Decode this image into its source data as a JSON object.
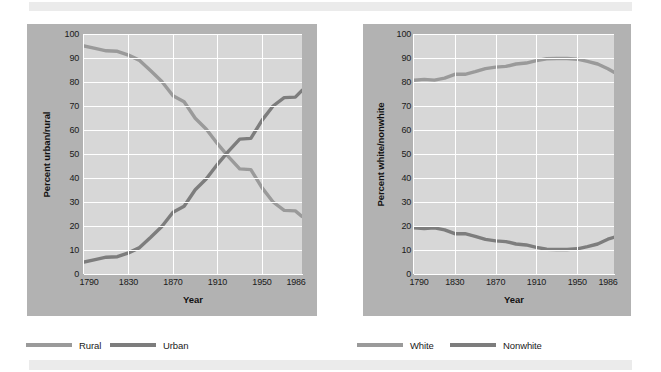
{
  "figure": {
    "background_color": "#ffffff",
    "frame_color": "#b2b2b2",
    "plot_color": "#d7d7d7",
    "grid_color": "#ffffff"
  },
  "legend": {
    "items": [
      {
        "label": "Rural",
        "color": "#9a9a9a",
        "swatch_name": "legend-swatch-rural"
      },
      {
        "label": "Urban",
        "color": "#7d7d7d",
        "swatch_name": "legend-swatch-urban"
      },
      {
        "label": "White",
        "color": "#9a9a9a",
        "swatch_name": "legend-swatch-white"
      },
      {
        "label": "Nonwhite",
        "color": "#7d7d7d",
        "swatch_name": "legend-swatch-nonwhite"
      }
    ]
  },
  "chart_data": [
    {
      "type": "line",
      "title": "",
      "xlabel": "Year",
      "ylabel": "Percent urban/rural",
      "xlim": [
        1790,
        1986
      ],
      "ylim": [
        0,
        100
      ],
      "grid": true,
      "legend_position": "below-figure",
      "xticks": [
        1790,
        1830,
        1870,
        1910,
        1950,
        1986
      ],
      "xtick_labels": [
        "1790",
        "1830",
        "1870",
        "1910",
        "1950",
        "1986"
      ],
      "yticks": [
        0,
        10,
        20,
        30,
        40,
        50,
        60,
        70,
        80,
        90,
        100
      ],
      "ytick_labels": [
        "0",
        "10",
        "20",
        "30",
        "40",
        "50",
        "60",
        "70",
        "80",
        "90",
        "100"
      ],
      "x": [
        1790,
        1800,
        1810,
        1820,
        1830,
        1840,
        1850,
        1860,
        1870,
        1880,
        1890,
        1900,
        1910,
        1920,
        1930,
        1940,
        1950,
        1960,
        1970,
        1980,
        1986
      ],
      "series": [
        {
          "name": "Rural",
          "color": "#9a9a9a",
          "values": [
            95,
            94,
            93,
            92.8,
            91.2,
            89,
            84.7,
            80.2,
            74.3,
            71.8,
            64.9,
            60.3,
            54.3,
            48.8,
            43.8,
            43.5,
            36,
            30,
            26.5,
            26.3,
            24
          ]
        },
        {
          "name": "Urban",
          "color": "#7d7d7d",
          "values": [
            5,
            6,
            7,
            7.2,
            8.8,
            11,
            15.3,
            19.8,
            25.7,
            28.2,
            35.1,
            39.7,
            45.7,
            51.2,
            56.2,
            56.5,
            64,
            70,
            73.5,
            73.7,
            76.5
          ]
        }
      ]
    },
    {
      "type": "line",
      "title": "",
      "xlabel": "Year",
      "ylabel": "Percent white/nonwhite",
      "xlim": [
        1790,
        1986
      ],
      "ylim": [
        0,
        100
      ],
      "grid": true,
      "legend_position": "below-figure",
      "xticks": [
        1790,
        1830,
        1870,
        1910,
        1950,
        1986
      ],
      "xtick_labels": [
        "1790",
        "1830",
        "1870",
        "1910",
        "1950",
        "1986"
      ],
      "yticks": [
        0,
        10,
        20,
        30,
        40,
        50,
        60,
        70,
        80,
        90,
        100
      ],
      "ytick_labels": [
        "0",
        "10",
        "20",
        "30",
        "40",
        "50",
        "60",
        "70",
        "80",
        "90",
        "100"
      ],
      "x": [
        1790,
        1800,
        1810,
        1820,
        1830,
        1840,
        1850,
        1860,
        1870,
        1880,
        1890,
        1900,
        1910,
        1920,
        1930,
        1940,
        1950,
        1960,
        1970,
        1980,
        1986
      ],
      "series": [
        {
          "name": "White",
          "color": "#9a9a9a",
          "values": [
            80.7,
            81.1,
            80.8,
            81.6,
            83.2,
            83.2,
            84.3,
            85.6,
            86.2,
            86.5,
            87.5,
            87.9,
            88.9,
            89.7,
            89.8,
            89.8,
            89.5,
            88.6,
            87.5,
            85.5,
            84.1
          ]
        },
        {
          "name": "Nonwhite",
          "color": "#7d7d7d",
          "values": [
            19.3,
            18.9,
            19.2,
            18.4,
            16.8,
            16.8,
            15.7,
            14.4,
            13.8,
            13.5,
            12.5,
            12.1,
            11.1,
            10.3,
            10.2,
            10.2,
            10.5,
            11.4,
            12.5,
            14.5,
            15.3
          ]
        }
      ]
    }
  ]
}
